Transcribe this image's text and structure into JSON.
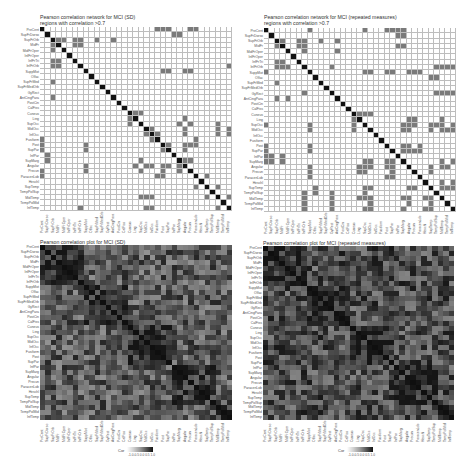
{
  "chart_data": [
    {
      "type": "heatmap",
      "title": "Pearson correlation network for MCI (SD)",
      "subtitle": "regions with correlation >0.7",
      "labels": [
        "PreCent",
        "SupFrDorso",
        "SupFrOrb",
        "MidFr",
        "MidFrOper",
        "InfFrOper",
        "InfFrTri",
        "InfFrOrb",
        "SuppMot",
        "Olfac",
        "SupFrMed",
        "SupFrMedOrb",
        "GyRect",
        "AntCingPara",
        "PostCin",
        "CalFiss",
        "Cuneus",
        "Ling",
        "SupOcc",
        "MidOcc",
        "InfOcc",
        "Fusiform",
        "Post",
        "SupPar",
        "InfPar",
        "SupMarg",
        "Angular",
        "Precun",
        "ParacenLob",
        "Heschl",
        "SupTemp",
        "TempPolSup",
        "MidTemp",
        "TempPolMid",
        "InfTemp"
      ],
      "edges_gt_0_7": [
        [
          0,
          21
        ],
        [
          0,
          22
        ],
        [
          0,
          27
        ],
        [
          1,
          24
        ],
        [
          2,
          3
        ],
        [
          2,
          6
        ],
        [
          2,
          7
        ],
        [
          2,
          10
        ],
        [
          2,
          13
        ],
        [
          3,
          6
        ],
        [
          3,
          7
        ],
        [
          4,
          2
        ],
        [
          6,
          2
        ],
        [
          6,
          3
        ],
        [
          7,
          2
        ],
        [
          7,
          3
        ],
        [
          7,
          34
        ],
        [
          8,
          22
        ],
        [
          8,
          26
        ],
        [
          10,
          2
        ],
        [
          13,
          2
        ],
        [
          16,
          17
        ],
        [
          18,
          16
        ],
        [
          18,
          25
        ],
        [
          19,
          20
        ],
        [
          19,
          26
        ],
        [
          19,
          32
        ],
        [
          20,
          21
        ],
        [
          20,
          26
        ],
        [
          20,
          32
        ],
        [
          20,
          34
        ],
        [
          22,
          0
        ],
        [
          22,
          23
        ],
        [
          22,
          26
        ],
        [
          23,
          0
        ],
        [
          23,
          8
        ],
        [
          23,
          22
        ],
        [
          23,
          26
        ],
        [
          25,
          1
        ],
        [
          26,
          17
        ],
        [
          26,
          25
        ],
        [
          27,
          8
        ],
        [
          27,
          18
        ],
        [
          27,
          22
        ],
        [
          27,
          25
        ],
        [
          28,
          0
        ],
        [
          28,
          21
        ],
        [
          28,
          22
        ],
        [
          30,
          28
        ],
        [
          30,
          32
        ],
        [
          32,
          18
        ],
        [
          32,
          19
        ],
        [
          32,
          30
        ],
        [
          32,
          34
        ],
        [
          34,
          7
        ],
        [
          34,
          19
        ],
        [
          34,
          32
        ]
      ],
      "legend": "binary (present / absent)"
    },
    {
      "type": "heatmap",
      "title": "Pearson correlation network for MCI (repeated measures)",
      "subtitle": "regions with correlation >0.7",
      "labels": [
        "PreCent",
        "SupFrDorso",
        "SupFrOrb",
        "MidFr",
        "MidFrOper",
        "InfFrOper",
        "InfFrTri",
        "InfFrOrb",
        "SuppMot",
        "Olfac",
        "SupFrMed",
        "SupFrMedOrb",
        "GyRect",
        "AntCingPara",
        "PostCin",
        "CalFiss",
        "Cuneus",
        "Ling",
        "SupOcc",
        "MidOcc",
        "InfOcc",
        "Fusiform",
        "Post",
        "SupPar",
        "InfPar",
        "SupMarg",
        "Angular",
        "Precun",
        "ParacenLob",
        "Heschl",
        "SupTemp",
        "TempPolSup",
        "MidTemp",
        "TempPolMid",
        "InfTemp"
      ],
      "edges_gt_0_7": [
        [
          0,
          8
        ],
        [
          0,
          18
        ],
        [
          0,
          22
        ],
        [
          0,
          23
        ],
        [
          0,
          25
        ],
        [
          1,
          25
        ],
        [
          2,
          3
        ],
        [
          2,
          6
        ],
        [
          2,
          7
        ],
        [
          2,
          10
        ],
        [
          2,
          13
        ],
        [
          3,
          2
        ],
        [
          3,
          6
        ],
        [
          3,
          7
        ],
        [
          3,
          25
        ],
        [
          4,
          7
        ],
        [
          4,
          13
        ],
        [
          6,
          2
        ],
        [
          6,
          3
        ],
        [
          7,
          2
        ],
        [
          7,
          3
        ],
        [
          7,
          12
        ],
        [
          7,
          31
        ],
        [
          7,
          33
        ],
        [
          8,
          0
        ],
        [
          8,
          18
        ],
        [
          8,
          19
        ],
        [
          8,
          22
        ],
        [
          8,
          26
        ],
        [
          8,
          27
        ],
        [
          9,
          30
        ],
        [
          10,
          2
        ],
        [
          12,
          7
        ],
        [
          12,
          31
        ],
        [
          12,
          33
        ],
        [
          13,
          2
        ],
        [
          13,
          4
        ],
        [
          16,
          17
        ],
        [
          16,
          18
        ],
        [
          18,
          0
        ],
        [
          18,
          8
        ],
        [
          18,
          16
        ],
        [
          18,
          25
        ],
        [
          18,
          26
        ],
        [
          18,
          31
        ],
        [
          19,
          8
        ],
        [
          19,
          16
        ],
        [
          19,
          25
        ],
        [
          19,
          26
        ],
        [
          19,
          30
        ],
        [
          19,
          33
        ],
        [
          22,
          0
        ],
        [
          22,
          8
        ],
        [
          22,
          25
        ],
        [
          22,
          26
        ],
        [
          23,
          0
        ],
        [
          23,
          8
        ],
        [
          23,
          25
        ],
        [
          23,
          26
        ],
        [
          24,
          0
        ],
        [
          24,
          1
        ],
        [
          24,
          3
        ],
        [
          26,
          17
        ],
        [
          26,
          18
        ],
        [
          26,
          22
        ],
        [
          26,
          23
        ],
        [
          26,
          30
        ],
        [
          26,
          33
        ],
        [
          27,
          8
        ],
        [
          27,
          17
        ],
        [
          27,
          18
        ],
        [
          27,
          23
        ],
        [
          27,
          30
        ],
        [
          28,
          8
        ],
        [
          28,
          22
        ],
        [
          28,
          23
        ],
        [
          30,
          18
        ],
        [
          30,
          19
        ],
        [
          30,
          30
        ],
        [
          31,
          9
        ],
        [
          31,
          18
        ],
        [
          32,
          7
        ],
        [
          32,
          12
        ],
        [
          32,
          17
        ],
        [
          32,
          18
        ],
        [
          32,
          19
        ],
        [
          32,
          25
        ],
        [
          32,
          26
        ],
        [
          32,
          29
        ],
        [
          32,
          30
        ],
        [
          33,
          30
        ],
        [
          34,
          7
        ],
        [
          34,
          12
        ],
        [
          34,
          18
        ],
        [
          34,
          19
        ],
        [
          34,
          25
        ],
        [
          34,
          29
        ],
        [
          34,
          30
        ]
      ],
      "legend": "binary (present / absent)"
    },
    {
      "type": "heatmap",
      "title": "Pearson correlation plot for MCI (SD)",
      "labels": [
        "PreCent",
        "SupFrDorso",
        "SupFrOrb",
        "MidFr",
        "MidFrOper",
        "InfFrOper",
        "InfFrTri",
        "InfFrOrb",
        "SuppMot",
        "Olfac",
        "SupFrMed",
        "SupFrMedOrb",
        "GyRect",
        "AntCingPara",
        "PostCin",
        "CalFiss",
        "Cuneus",
        "Ling",
        "SupOcc",
        "MidOcc",
        "InfOcc",
        "Fusiform",
        "Post",
        "SupPar",
        "InfPar",
        "SupMarg",
        "Angular",
        "Precun",
        "ParacenLob",
        "Heschl",
        "SupTemp",
        "TempPolSup",
        "MidTemp",
        "TempPolMid",
        "InfTemp"
      ],
      "legend_title": "Cor",
      "legend_ticks": [
        "-1.0",
        "-0.5",
        "0.0",
        "0.5",
        "1.0"
      ],
      "value_range": [
        -1.0,
        1.0
      ],
      "diagonal": 1.0,
      "colormap": "greyscale (light = low, black = high)"
    },
    {
      "type": "heatmap",
      "title": "Pearson correlation plot for MCI (repeated measures)",
      "labels": [
        "PreCent",
        "SupFrDorso",
        "SupFrOrb",
        "MidFr",
        "MidFrOper",
        "InfFrOper",
        "InfFrTri",
        "InfFrOrb",
        "SuppMot",
        "Olfac",
        "SupFrMed",
        "SupFrMedOrb",
        "GyRect",
        "AntCingPara",
        "PostCin",
        "CalFiss",
        "Cuneus",
        "Ling",
        "SupOcc",
        "MidOcc",
        "InfOcc",
        "Fusiform",
        "Post",
        "SupPar",
        "InfPar",
        "SupMarg",
        "Angular",
        "Precun",
        "ParacenLob",
        "Heschl",
        "SupTemp",
        "TempPolSup",
        "MidTemp",
        "TempPolMid",
        "InfTemp"
      ],
      "legend_title": "Cor",
      "legend_ticks": [
        "-1.0",
        "-0.5",
        "0.0",
        "0.5",
        "1.0"
      ],
      "value_range": [
        -1.0,
        1.0
      ],
      "diagonal": 1.0,
      "colormap": "greyscale (light = low, black = high)"
    }
  ],
  "panels": {
    "tl": {
      "title": "Pearson correlation network for MCI (SD)",
      "subtitle": "regions with correlation >0.7"
    },
    "tr": {
      "title": "Pearson correlation network for MCI (repeated measures)",
      "subtitle": "regions with correlation >0.7"
    },
    "bl": {
      "title": "Pearson correlation plot for MCI (SD)",
      "legend_title": "Cor",
      "legend_ticks": "-1.0-0.5 0.0 0.5 1.0"
    },
    "br": {
      "title": "Pearson correlation plot for MCI (repeated measures)",
      "legend_title": "Cor",
      "legend_ticks": "-1.0-0.5 0.0 0.5 1.0"
    }
  },
  "colors": {
    "diagonal": "#111111",
    "edge": "#7a7a7a",
    "empty": "#ffffff",
    "gridline": "#bdbdbd"
  }
}
